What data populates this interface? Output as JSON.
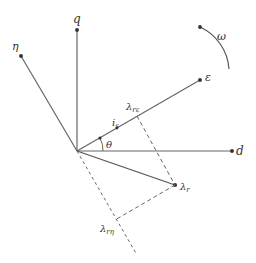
{
  "diagram": {
    "type": "vector-diagram",
    "colors": {
      "line": "#555555",
      "text": "#333333",
      "background": "#ffffff"
    },
    "axes": [
      {
        "id": "q",
        "label": "q"
      },
      {
        "id": "d",
        "label": "d"
      },
      {
        "id": "eta",
        "label": "η"
      },
      {
        "id": "epsilon",
        "label": "ε"
      }
    ],
    "vectors": [
      {
        "id": "is",
        "label": "i",
        "subscript": "s"
      },
      {
        "id": "lambda_r",
        "label": "λ",
        "subscript": "r"
      }
    ],
    "projections": [
      {
        "id": "lambda_r_eps",
        "label": "λ",
        "subscript": "rε"
      },
      {
        "id": "lambda_r_eta",
        "label": "λ",
        "subscript": "rη"
      }
    ],
    "angle": {
      "label": "θ"
    },
    "rotation": {
      "label": "ω"
    }
  }
}
